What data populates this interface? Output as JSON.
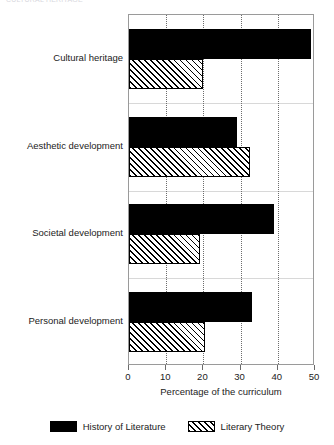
{
  "top_caption": "CULTURAL HERITAGE",
  "chart_data": {
    "type": "bar",
    "orientation": "horizontal",
    "title": "",
    "xlabel": "Percentage of the curriculum",
    "ylabel": "",
    "xlim": [
      0,
      50
    ],
    "xticks": [
      0,
      10,
      20,
      30,
      40,
      50
    ],
    "grid": "vertical dotted gridlines at 10, 20, 30, 40",
    "legend_position": "bottom-center",
    "categories": [
      "Cultural heritage",
      "Aesthetic development",
      "Societal development",
      "Personal development"
    ],
    "series": [
      {
        "name": "History of Literature",
        "fill": "solid-black",
        "color": "#000000",
        "values": [
          49,
          29,
          39,
          33
        ]
      },
      {
        "name": "Literary Theory",
        "fill": "diagonal-hatch",
        "color": "#000000",
        "values": [
          20,
          32.5,
          19,
          20.5
        ]
      }
    ]
  },
  "legend": {
    "items": [
      {
        "label": "History of Literature",
        "style": "solid"
      },
      {
        "label": "Literary Theory",
        "style": "hatch"
      }
    ]
  }
}
